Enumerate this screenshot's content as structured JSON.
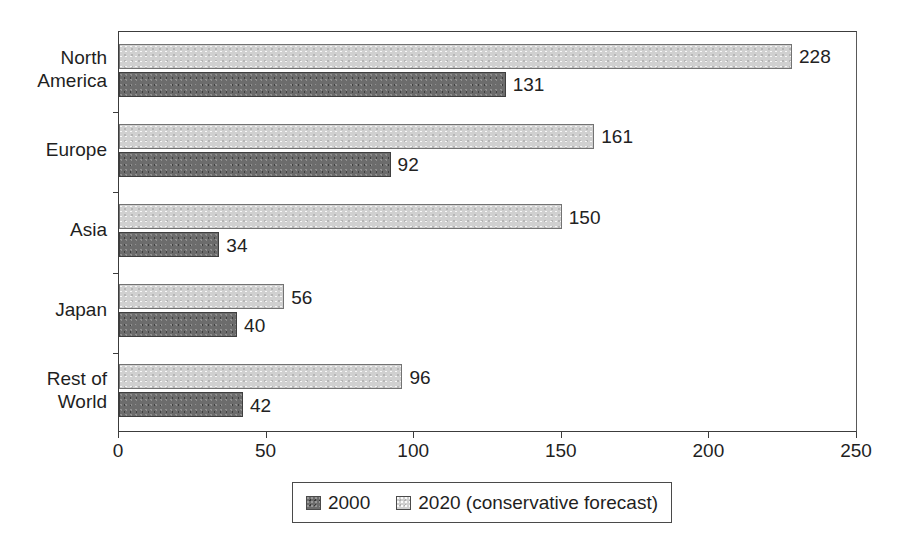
{
  "chart_data": {
    "type": "bar",
    "orientation": "horizontal",
    "title": "",
    "xlabel": "",
    "ylabel": "",
    "xlim": [
      0,
      250
    ],
    "xticks": [
      0,
      50,
      100,
      150,
      200,
      250
    ],
    "xtick_labels": [
      "0",
      "50",
      "100",
      "150",
      "200",
      "250"
    ],
    "grid": false,
    "legend_position": "bottom",
    "categories": [
      "North\nAmerica",
      "Europe",
      "Asia",
      "Japan",
      "Rest of\nWorld"
    ],
    "series": [
      {
        "name": "2020 (conservative forecast)",
        "color": "#d0d0d0",
        "values": [
          228,
          161,
          150,
          56,
          96
        ],
        "value_labels": [
          "228",
          "161",
          "150",
          "56",
          "96"
        ]
      },
      {
        "name": "2000",
        "color": "#6c6c6c",
        "values": [
          131,
          92,
          34,
          40,
          42
        ],
        "value_labels": [
          "131",
          "92",
          "34",
          "40",
          "42"
        ]
      }
    ]
  },
  "legend": {
    "items": [
      {
        "label": "2000",
        "swatch": "dark-swatch-icon"
      },
      {
        "label": "2020 (conservative forecast)",
        "swatch": "light-swatch-icon"
      }
    ]
  }
}
